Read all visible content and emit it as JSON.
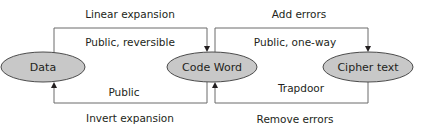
{
  "nodes": {
    "data": {
      "label": "Data"
    },
    "code_word": {
      "label": "Code Word"
    },
    "cipher_text": {
      "label": "Cipher text"
    }
  },
  "edges": {
    "encode_top": {
      "label": "Linear expansion",
      "sublabel": "Public, reversible"
    },
    "encode_bottom": {
      "label": "Invert expansion",
      "sublabel": "Public"
    },
    "cipher_top": {
      "label": "Add errors",
      "sublabel": "Public, one-way"
    },
    "cipher_bottom": {
      "label": "Remove errors",
      "sublabel": "Trapdoor"
    }
  },
  "colors": {
    "node_fill": "#c8c8c8",
    "line": "#5a5a5a",
    "text": "#231f20"
  }
}
